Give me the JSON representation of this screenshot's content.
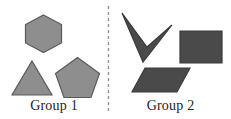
{
  "figure": {
    "background_color": "#ffffff",
    "width": 231,
    "height": 119
  },
  "divider": {
    "name": "dashed-vertical-divider",
    "orientation": "vertical",
    "x": 108.5,
    "y_start": 6,
    "y_end": 112,
    "color": "#8d8d8d",
    "dash_pattern": "3 3",
    "stroke_width": 1.3
  },
  "groups": [
    {
      "id": "group-1",
      "label": "Group 1",
      "fill_color": "#8e8e8e",
      "stroke_color": "#5a5a5a",
      "shapes": [
        {
          "name": "hexagon",
          "label": "hexagon",
          "points": "43.5,15 61.5,24.5 61.5,43 43.5,52.5 25.5,43 25.5,24.5"
        },
        {
          "name": "triangle",
          "label": "triangle",
          "points": "32,61 52,95 12,95"
        },
        {
          "name": "pentagon",
          "label": "pentagon",
          "points": "77.5,57.5 99.5,73.5 91,97.5 64,97.5 55.5,73.5"
        }
      ]
    },
    {
      "id": "group-2",
      "label": "Group 2",
      "fill_color": "#4a4a4a",
      "stroke_color": "#3a3a3a",
      "shapes": [
        {
          "name": "chevron",
          "label": "chevron",
          "points": "122,13 147,47 172,25 143,62"
        },
        {
          "name": "rectangle",
          "label": "rectangle",
          "points": "180,31 222,31 222,63 180,63"
        },
        {
          "name": "parallelogram",
          "label": "parallelogram",
          "points": "145,68 190,68 177,92 132,92"
        }
      ]
    }
  ]
}
